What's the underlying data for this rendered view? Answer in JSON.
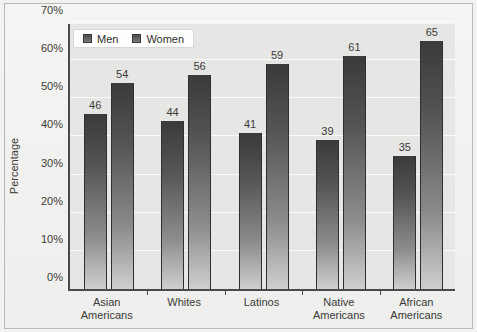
{
  "chart_data": {
    "type": "bar",
    "title": "",
    "xlabel": "",
    "ylabel": "Percentage",
    "ylim": [
      0,
      70
    ],
    "ytick_labels": [
      "0%",
      "10%",
      "20%",
      "30%",
      "40%",
      "50%",
      "60%",
      "70%"
    ],
    "ytick_values": [
      0,
      10,
      20,
      30,
      40,
      50,
      60,
      70
    ],
    "grid": true,
    "legend_position": "top-left",
    "categories": [
      "Asian Americans",
      "Whites",
      "Latinos",
      "Native Americans",
      "African Americans"
    ],
    "category_lines": [
      [
        "Asian",
        "Americans"
      ],
      [
        "Whites",
        ""
      ],
      [
        "Latinos",
        ""
      ],
      [
        "Native",
        "Americans"
      ],
      [
        "African",
        "Americans"
      ]
    ],
    "series": [
      {
        "name": "Men",
        "values": [
          46,
          44,
          41,
          39,
          35
        ]
      },
      {
        "name": "Women",
        "values": [
          54,
          56,
          59,
          61,
          65
        ]
      }
    ],
    "colors": {
      "bar_dark": "#3a3a38",
      "bar_light": "#cfcfcd",
      "plot_background": "#e6e6e4",
      "gridline": "#fbfbfa",
      "axis": "#4a4a48",
      "text": "#3b3b39",
      "legend_background": "#fdfdfc"
    }
  }
}
